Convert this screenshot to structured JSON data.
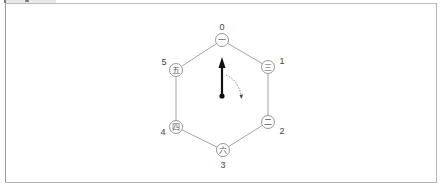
{
  "figure": {
    "title": "",
    "nodes": [
      {
        "index": "0",
        "glyph": "一",
        "x": 222,
        "y": 40,
        "label_x": 222,
        "label_y": 27
      },
      {
        "index": "1",
        "glyph": "三",
        "x": 268,
        "y": 67,
        "label_x": 282,
        "label_y": 61
      },
      {
        "index": "2",
        "glyph": "二",
        "x": 268,
        "y": 122,
        "label_x": 282,
        "label_y": 131
      },
      {
        "index": "3",
        "glyph": "六",
        "x": 223,
        "y": 150,
        "label_x": 223,
        "label_y": 165
      },
      {
        "index": "4",
        "glyph": "四",
        "x": 176,
        "y": 127,
        "label_x": 163,
        "label_y": 132
      },
      {
        "index": "5",
        "glyph": "五",
        "x": 176,
        "y": 70,
        "label_x": 164,
        "label_y": 62
      }
    ],
    "pointer": {
      "points_to_index": "0",
      "base": {
        "x": 222,
        "y": 96
      },
      "tip": {
        "x": 222,
        "y": 60
      }
    },
    "rotation_hint": {
      "direction": "clockwise",
      "style": "dotted"
    },
    "colors": {
      "node_stroke": "#8a8a8a",
      "edge": "#9a9a9a",
      "pointer": "#111111",
      "text": "#444444"
    }
  }
}
